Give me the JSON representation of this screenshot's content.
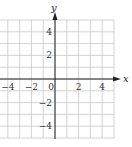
{
  "chart_data": {
    "type": "scatter",
    "title": "",
    "xlabel": "x",
    "ylabel": "y",
    "xlim": [
      -5,
      5
    ],
    "ylim": [
      -5,
      5
    ],
    "grid": true,
    "grid_step": 1,
    "x_ticks": [
      -4,
      -2,
      0,
      2,
      4
    ],
    "y_ticks": [
      4,
      2,
      -2,
      -4
    ],
    "x_tick_labels": [
      "−4",
      "−2",
      "0",
      "2",
      "4"
    ],
    "y_tick_labels": [
      "4",
      "2",
      "−2",
      "−4"
    ],
    "series": [],
    "legend": null
  },
  "style": {
    "grid_color": "#c8c8c8",
    "axis_color": "#222222"
  }
}
